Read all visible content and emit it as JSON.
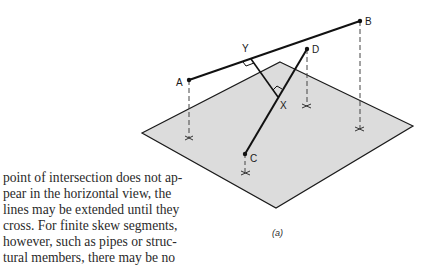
{
  "figure": {
    "caption": "(a)",
    "labels": {
      "A": "A",
      "B": "B",
      "C": "C",
      "D": "D",
      "X": "X",
      "Y": "Y"
    },
    "colors": {
      "plane_fill": "#dcdcdc",
      "plane_stroke": "#1a1a1a",
      "line": "#111111",
      "dashed": "#444444",
      "background": "#ffffff"
    }
  },
  "text": {
    "lines": [
      "point of intersection does not ap-",
      "pear in the horizontal view, the",
      "lines may be extended until they",
      "cross. For finite skew segments,",
      "however, such as pipes or struc-",
      "tural members, there may be no"
    ]
  }
}
